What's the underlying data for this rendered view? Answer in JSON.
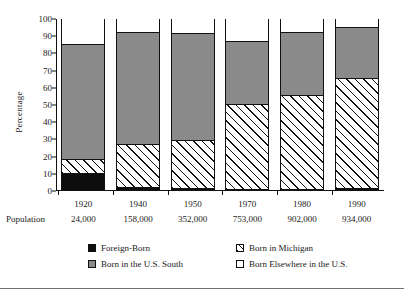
{
  "chart_data": {
    "type": "bar",
    "subtype": "stacked-percentage",
    "title": "",
    "xlabel": "",
    "ylabel": "Percentage",
    "ylim": [
      0,
      100
    ],
    "yticks": [
      0,
      10,
      20,
      30,
      40,
      50,
      60,
      70,
      80,
      90,
      100
    ],
    "grid": false,
    "legend_position": "bottom",
    "categories": [
      "1920",
      "1940",
      "1950",
      "1970",
      "1980",
      "1990"
    ],
    "population_row_label": "Population",
    "population": [
      "24,000",
      "158,000",
      "352,000",
      "753,000",
      "902,000",
      "934,000"
    ],
    "series": [
      {
        "name": "Foreign-Born",
        "color": "#0d0d0d",
        "pattern": "solid-black",
        "values": [
          10,
          1.5,
          1,
          0.6,
          0.6,
          1
        ]
      },
      {
        "name": "Born in Michigan",
        "color": "#ffffff",
        "pattern": "diagonal-hatch",
        "values": [
          8,
          25.5,
          28,
          49.4,
          54.9,
          64
        ]
      },
      {
        "name": "Born in the U.S. South",
        "color": "#8a8a8a",
        "pattern": "solid-gray",
        "values": [
          67,
          65,
          62.5,
          36.5,
          36.5,
          29.5
        ]
      },
      {
        "name": "Born Elsewhere in the U.S.",
        "color": "#ffffff",
        "pattern": "solid-white",
        "values": [
          15,
          8,
          8.5,
          13.5,
          8,
          5.5
        ]
      }
    ],
    "cumulative_tops": {
      "1920": {
        "foreign": 10,
        "michigan": 18,
        "south": 85,
        "else": 100
      },
      "1940": {
        "foreign": 1.5,
        "michigan": 27,
        "south": 92,
        "else": 100
      },
      "1950": {
        "foreign": 1,
        "michigan": 29,
        "south": 91.5,
        "else": 100
      },
      "1970": {
        "foreign": 0.6,
        "michigan": 50,
        "south": 86.5,
        "else": 100
      },
      "1980": {
        "foreign": 0.6,
        "michigan": 55.5,
        "south": 92,
        "else": 100
      },
      "1990": {
        "foreign": 1,
        "michigan": 65,
        "south": 94.5,
        "else": 100
      }
    }
  },
  "legend": {
    "items": [
      {
        "label": "Foreign-Born"
      },
      {
        "label": "Born in Michigan"
      },
      {
        "label": "Born in the U.S. South"
      },
      {
        "label": "Born Elsewhere in the U.S."
      }
    ]
  }
}
